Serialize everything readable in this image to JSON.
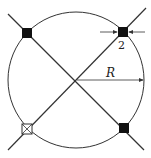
{
  "diagram": {
    "type": "circle-with-diagonals",
    "circle": {
      "cx": 76,
      "cy": 80,
      "r": 68,
      "stroke": "#333333"
    },
    "diagonals": [
      {
        "x1": 8,
        "y1": 14,
        "x2": 144,
        "y2": 150
      },
      {
        "x1": 146,
        "y1": 8,
        "x2": 8,
        "y2": 150
      }
    ],
    "markers": [
      {
        "position": "top-left",
        "x": 27,
        "y": 33,
        "style": "filled"
      },
      {
        "position": "top-right",
        "x": 123,
        "y": 32,
        "style": "filled"
      },
      {
        "position": "bottom-right",
        "x": 124,
        "y": 128,
        "style": "filled"
      },
      {
        "position": "bottom-left",
        "x": 27,
        "y": 129,
        "style": "open-cross"
      }
    ],
    "radius_label": "R",
    "dimension_label": "2",
    "colors": {
      "line": "#333333",
      "fill": "#111111",
      "background": "#ffffff"
    }
  }
}
